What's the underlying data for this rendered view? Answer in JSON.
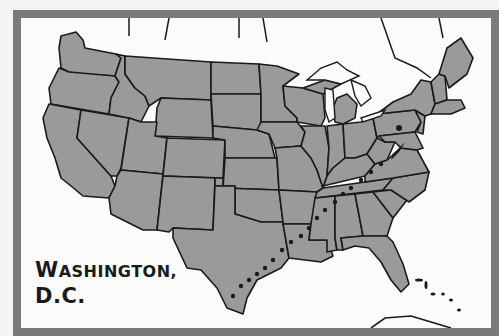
{
  "map": {
    "title_line1_initial": "W",
    "title_line1_rest": "ASHINGTON,",
    "title_line2": "D.C.",
    "region": "Contiguous United States",
    "highlighted_location": "Washington, D.C.",
    "route": "Dotted route from South Texas coast northeast along the Gulf states to Washington, D.C.",
    "colors": {
      "land": "#9a9a9a",
      "state_border": "#1a1a1a",
      "water_background": "#fbfbfa",
      "frame": "#7a7a7a",
      "route_dots": "#1a1a1a",
      "label_text": "#1a1a1a"
    }
  }
}
